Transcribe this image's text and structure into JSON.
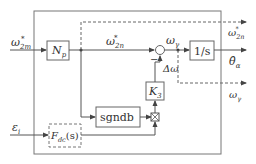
{
  "diagram": {
    "type": "block-diagram",
    "inputs": {
      "omega_2m_star": {
        "base": "ω",
        "sub": "2m",
        "sup": "*"
      },
      "epsilon_i": {
        "base": "ε",
        "sub": "i"
      }
    },
    "outputs": {
      "omega_2n_star": {
        "base": "ω",
        "sub": "2n",
        "sup": "*"
      },
      "theta_hat_alpha": {
        "base": "θ̂",
        "sub": "α"
      },
      "omega_gamma": {
        "base": "ω",
        "sub": "γ"
      }
    },
    "signals": {
      "omega_2n_star_mid": {
        "base": "ω",
        "sub": "2n",
        "sup": "*"
      },
      "omega_gamma_mid": {
        "base": "ω",
        "sub": "γ"
      },
      "delta_omega": "Δω",
      "minus_sign": "−"
    },
    "blocks": {
      "np": {
        "base": "N",
        "sub": "p"
      },
      "integrator": "1/s",
      "k3": {
        "base": "K",
        "sub": "3"
      },
      "sgndb": "sgndb",
      "fdc": {
        "base": "F",
        "sub": "dc",
        "suffix": "(s)"
      }
    },
    "colors": {
      "line": "#555555",
      "text": "#333333",
      "background": "#ffffff"
    }
  }
}
